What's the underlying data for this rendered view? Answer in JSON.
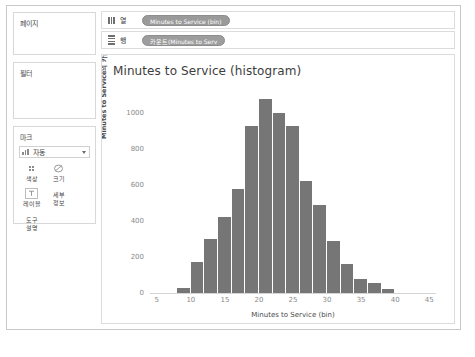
{
  "window": {
    "title": "Tableau Worksheet"
  },
  "sidebar": {
    "cards": [
      {
        "name": "pages",
        "title": "페이지"
      },
      {
        "name": "filters",
        "title": "필터"
      },
      {
        "name": "marks",
        "title": "마크"
      }
    ],
    "marks": {
      "type_selected": "자동",
      "buttons": [
        {
          "name": "color",
          "label": "색상",
          "icon": "color-dots-icon"
        },
        {
          "name": "size",
          "label": "크기",
          "icon": "size-circle-icon"
        },
        {
          "name": "label",
          "label": "레이블",
          "icon": "label-tag-icon"
        },
        {
          "name": "detail",
          "label": "세부\n정보",
          "icon": "detail-icon"
        },
        {
          "name": "tooltip",
          "label": "도구\n설명",
          "icon": "tooltip-icon"
        }
      ],
      "detail_label_line1": "세부",
      "detail_label_line2": "정보",
      "tooltip_label_line1": "도구",
      "tooltip_label_line2": "설명"
    }
  },
  "shelves": {
    "columns": {
      "label": "열",
      "icon": "columns-icon",
      "pill": "Minutes to Service (bin)"
    },
    "rows": {
      "label": "행",
      "icon": "rows-icon",
      "pill": "카운트(Minutes to Serv"
    }
  },
  "chart_data": {
    "type": "bar",
    "title": "Minutes to Service (histogram)",
    "xlabel": "Minutes to Service (bin)",
    "ylabel": "Minutes to Service의 카운트",
    "categories": [
      8,
      10,
      12,
      14,
      16,
      18,
      20,
      22,
      24,
      26,
      28,
      30,
      32,
      34,
      36,
      38
    ],
    "values": [
      30,
      175,
      300,
      420,
      580,
      930,
      1080,
      1000,
      930,
      620,
      490,
      290,
      160,
      80,
      55,
      20
    ],
    "bin_width": 2,
    "xlim": [
      4,
      46
    ],
    "ylim": [
      0,
      1100
    ],
    "xticks": [
      5,
      10,
      15,
      20,
      25,
      30,
      35,
      40,
      45
    ],
    "yticks": [
      0,
      200,
      400,
      600,
      800,
      1000
    ],
    "grid": false,
    "legend": "none",
    "bar_color": "#767676"
  }
}
